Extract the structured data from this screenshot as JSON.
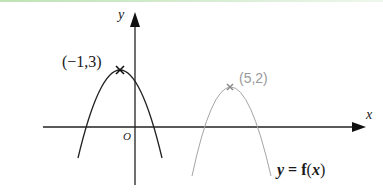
{
  "diagram": {
    "type": "function-graph",
    "axes": {
      "x_label": "x",
      "y_label": "y",
      "origin_label": "O"
    },
    "curves": [
      {
        "name": "original",
        "style": "solid-black",
        "shape": "downward-parabola",
        "vertex_label": "(−1,3)",
        "vertex": [
          -1,
          3
        ],
        "color": "#222222"
      },
      {
        "name": "translated",
        "style": "thin-gray",
        "shape": "downward-parabola",
        "vertex_label": "(5,2)",
        "vertex": [
          5,
          2
        ],
        "color": "#9a9a9a"
      }
    ],
    "function_label": {
      "y": "y",
      "eq": " = ",
      "f": "f",
      "open": "(",
      "x": "x",
      "close": ")"
    }
  }
}
